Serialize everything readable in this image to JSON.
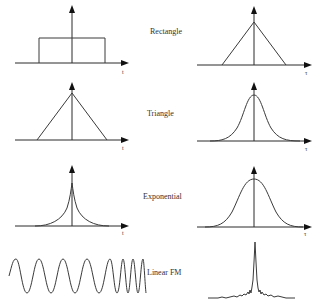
{
  "diagram": {
    "title": "",
    "columns": {
      "left": "Signal waveform (time domain)",
      "right": "Autocorrelation function"
    },
    "rows": [
      {
        "label": "Rectangle",
        "left": {
          "shape": "rectangle-pulse",
          "axis_label": "t"
        },
        "right": {
          "shape": "triangle",
          "axis_label": "τ"
        }
      },
      {
        "label": "Triangle",
        "left": {
          "shape": "triangle",
          "axis_label": "t"
        },
        "right": {
          "shape": "smooth-bell",
          "axis_label": "τ"
        }
      },
      {
        "label": "Exponential",
        "left": {
          "shape": "two-sided-exponential-cusp",
          "axis_label": "t"
        },
        "right": {
          "shape": "smooth-bell",
          "axis_label": "τ"
        }
      },
      {
        "label": "Linear FM",
        "left": {
          "shape": "chirp-sinusoid",
          "axis_label": ""
        },
        "right": {
          "shape": "sharp-peak-with-sidelobes",
          "axis_label": ""
        }
      }
    ],
    "colors": {
      "line": "#3a3a3a",
      "background": "#ffffff"
    }
  }
}
